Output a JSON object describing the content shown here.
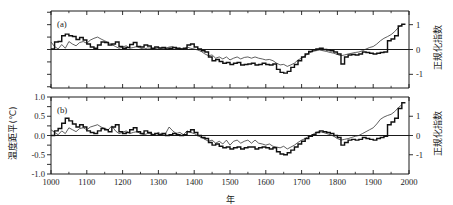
{
  "figure": {
    "xlabel": "年",
    "ylabel_left": "温度距平(℃)",
    "ylabel_right_a": "正规化指数",
    "ylabel_right_b": "正规化指数",
    "panel_a_tag": "(a)",
    "panel_b_tag": "(b)",
    "x_ticks": [
      "1000",
      "1100",
      "1200",
      "1300",
      "1400",
      "1500",
      "1600",
      "1700",
      "1800",
      "1900",
      "2000"
    ],
    "y_ticks_left_b": [
      "1.0",
      "0.5",
      "0.0",
      "-0.5",
      "-1.0"
    ],
    "y_ticks_right": [
      "1",
      "0",
      "-1"
    ],
    "line_color": "#111111",
    "thin_line_color": "#2b2b2b",
    "axis_color": "#1a1a1a",
    "background": "#ffffff"
  },
  "chart_data": [
    {
      "type": "line",
      "panel": "(a)",
      "title": "",
      "xlabel": "年",
      "ylabel": "正规化指数",
      "xlim": [
        1000,
        2000
      ],
      "ylim": [
        -1.55,
        1.55
      ],
      "grid": false,
      "legend": "none",
      "axis_right_ticks": [
        1,
        0,
        -1
      ],
      "zero_line": 0,
      "series": [
        {
          "name": "thick-stepped-reconstruction",
          "style": "thick step",
          "x": [
            1000,
            1010,
            1020,
            1030,
            1040,
            1050,
            1060,
            1070,
            1080,
            1090,
            1100,
            1110,
            1120,
            1130,
            1140,
            1150,
            1160,
            1170,
            1180,
            1190,
            1200,
            1210,
            1220,
            1230,
            1240,
            1250,
            1260,
            1270,
            1280,
            1290,
            1300,
            1310,
            1320,
            1330,
            1340,
            1350,
            1360,
            1370,
            1380,
            1390,
            1400,
            1410,
            1420,
            1430,
            1440,
            1450,
            1460,
            1470,
            1480,
            1490,
            1500,
            1510,
            1520,
            1530,
            1540,
            1550,
            1560,
            1570,
            1580,
            1590,
            1600,
            1610,
            1620,
            1630,
            1640,
            1650,
            1660,
            1670,
            1680,
            1690,
            1700,
            1710,
            1720,
            1730,
            1740,
            1750,
            1760,
            1770,
            1780,
            1790,
            1800,
            1810,
            1820,
            1830,
            1840,
            1850,
            1860,
            1870,
            1880,
            1890,
            1900,
            1910,
            1920,
            1930,
            1940,
            1950,
            1960,
            1970,
            1980
          ],
          "y": [
            0.02,
            0.3,
            0.32,
            0.55,
            0.62,
            0.55,
            0.52,
            0.4,
            0.48,
            0.38,
            0.22,
            0.1,
            0.05,
            0.18,
            0.3,
            0.28,
            0.18,
            0.22,
            0.3,
            0.12,
            0.05,
            0.08,
            0.2,
            0.28,
            0.12,
            0.1,
            0.18,
            0.14,
            0.05,
            0.1,
            0.06,
            0.08,
            0.02,
            0.05,
            0.08,
            0.05,
            0.02,
            0.05,
            0.18,
            0.22,
            0.1,
            0.02,
            -0.05,
            -0.1,
            -0.3,
            -0.45,
            -0.4,
            -0.48,
            -0.55,
            -0.52,
            -0.6,
            -0.55,
            -0.52,
            -0.62,
            -0.6,
            -0.58,
            -0.55,
            -0.62,
            -0.6,
            -0.55,
            -0.6,
            -0.62,
            -0.58,
            -0.8,
            -0.92,
            -0.95,
            -0.88,
            -0.72,
            -0.6,
            -0.45,
            -0.3,
            -0.18,
            -0.08,
            -0.02,
            0.02,
            0.05,
            0.0,
            -0.02,
            -0.05,
            -0.1,
            -0.18,
            -0.58,
            -0.3,
            -0.22,
            -0.2,
            -0.22,
            -0.18,
            -0.1,
            -0.12,
            -0.15,
            -0.18,
            -0.15,
            -0.12,
            -0.1,
            0.35,
            0.42,
            0.55,
            0.95,
            1.02
          ]
        },
        {
          "name": "thin-smoothed-index",
          "style": "thin line",
          "x": [
            1000,
            1010,
            1020,
            1030,
            1040,
            1050,
            1060,
            1070,
            1080,
            1090,
            1100,
            1110,
            1120,
            1130,
            1140,
            1150,
            1160,
            1170,
            1180,
            1190,
            1200,
            1210,
            1220,
            1230,
            1240,
            1250,
            1260,
            1270,
            1280,
            1290,
            1300,
            1310,
            1320,
            1330,
            1340,
            1350,
            1360,
            1370,
            1380,
            1390,
            1400,
            1410,
            1420,
            1430,
            1440,
            1450,
            1460,
            1470,
            1480,
            1490,
            1500,
            1510,
            1520,
            1530,
            1540,
            1550,
            1560,
            1570,
            1580,
            1590,
            1600,
            1610,
            1620,
            1630,
            1640,
            1650,
            1660,
            1670,
            1680,
            1690,
            1700,
            1710,
            1720,
            1730,
            1740,
            1750,
            1760,
            1770,
            1780,
            1790,
            1800,
            1810,
            1820,
            1830,
            1840,
            1850,
            1860,
            1870,
            1880,
            1890,
            1900,
            1910,
            1920,
            1930,
            1940,
            1950,
            1960,
            1970,
            1980
          ],
          "y": [
            0.3,
            0.12,
            0.02,
            0.2,
            0.05,
            0.32,
            0.22,
            0.15,
            0.28,
            0.32,
            0.25,
            0.38,
            0.45,
            0.5,
            0.42,
            0.35,
            0.28,
            0.2,
            0.12,
            0.05,
            0.1,
            0.15,
            0.05,
            0.08,
            0.12,
            0.05,
            0.02,
            0.06,
            0.05,
            0.02,
            0.08,
            0.02,
            0.05,
            0.1,
            0.12,
            0.02,
            0.05,
            0.0,
            0.1,
            0.05,
            0.02,
            -0.02,
            -0.08,
            -0.18,
            -0.25,
            -0.22,
            -0.35,
            -0.3,
            -0.38,
            -0.3,
            -0.42,
            -0.35,
            -0.3,
            -0.38,
            -0.32,
            -0.3,
            -0.35,
            -0.3,
            -0.35,
            -0.38,
            -0.42,
            -0.4,
            -0.45,
            -0.55,
            -0.62,
            -0.6,
            -0.68,
            -0.62,
            -0.55,
            -0.42,
            -0.35,
            -0.25,
            -0.15,
            -0.08,
            -0.05,
            -0.02,
            -0.05,
            -0.08,
            -0.12,
            -0.15,
            -0.2,
            -0.25,
            -0.22,
            -0.18,
            -0.15,
            -0.12,
            -0.1,
            -0.05,
            0.02,
            0.08,
            0.12,
            0.22,
            0.35,
            0.45,
            0.52,
            0.6,
            0.72,
            0.88,
            1.0
          ]
        }
      ]
    },
    {
      "type": "line",
      "panel": "(b)",
      "title": "",
      "xlabel": "年",
      "ylabel_left": "温度距平(℃)",
      "ylabel_right": "正规化指数",
      "xlim": [
        1000,
        2000
      ],
      "ylim_left": [
        -1.0,
        1.0
      ],
      "ylim_right": [
        -2.0,
        2.0
      ],
      "grid": false,
      "legend": "none",
      "axis_left_ticks": [
        1.0,
        0.5,
        0.0,
        -0.5,
        -1.0
      ],
      "axis_right_ticks": [
        1,
        0,
        -1
      ],
      "zero_line": 0,
      "series": [
        {
          "name": "thick-stepped-reconstruction",
          "style": "thick step",
          "x": [
            1000,
            1010,
            1020,
            1030,
            1040,
            1050,
            1060,
            1070,
            1080,
            1090,
            1100,
            1110,
            1120,
            1130,
            1140,
            1150,
            1160,
            1170,
            1180,
            1190,
            1200,
            1210,
            1220,
            1230,
            1240,
            1250,
            1260,
            1270,
            1280,
            1290,
            1300,
            1310,
            1320,
            1330,
            1340,
            1350,
            1360,
            1370,
            1380,
            1390,
            1400,
            1410,
            1420,
            1430,
            1440,
            1450,
            1460,
            1470,
            1480,
            1490,
            1500,
            1510,
            1520,
            1530,
            1540,
            1550,
            1560,
            1570,
            1580,
            1590,
            1600,
            1610,
            1620,
            1630,
            1640,
            1650,
            1660,
            1670,
            1680,
            1690,
            1700,
            1710,
            1720,
            1730,
            1740,
            1750,
            1760,
            1770,
            1780,
            1790,
            1800,
            1810,
            1820,
            1830,
            1840,
            1850,
            1860,
            1870,
            1880,
            1890,
            1900,
            1910,
            1920,
            1930,
            1940,
            1950,
            1960,
            1970,
            1980
          ],
          "y": [
            0.0,
            0.12,
            0.18,
            0.32,
            0.45,
            0.38,
            0.3,
            0.22,
            0.28,
            0.22,
            0.12,
            0.08,
            0.05,
            0.12,
            0.18,
            0.15,
            0.1,
            0.22,
            0.28,
            0.1,
            0.05,
            0.08,
            0.15,
            0.2,
            0.1,
            0.05,
            0.12,
            0.08,
            0.02,
            0.05,
            0.02,
            0.05,
            0.0,
            0.02,
            0.05,
            0.02,
            0.0,
            0.02,
            0.1,
            0.15,
            0.08,
            0.0,
            -0.05,
            -0.08,
            -0.18,
            -0.25,
            -0.22,
            -0.28,
            -0.32,
            -0.3,
            -0.35,
            -0.32,
            -0.3,
            -0.35,
            -0.32,
            -0.3,
            -0.3,
            -0.35,
            -0.32,
            -0.3,
            -0.32,
            -0.35,
            -0.32,
            -0.42,
            -0.48,
            -0.5,
            -0.45,
            -0.38,
            -0.3,
            -0.22,
            -0.15,
            -0.08,
            -0.02,
            0.02,
            0.08,
            0.12,
            0.1,
            0.08,
            0.05,
            0.0,
            -0.05,
            -0.25,
            -0.18,
            -0.12,
            -0.1,
            -0.12,
            -0.1,
            -0.05,
            -0.08,
            -0.1,
            -0.12,
            -0.08,
            -0.05,
            -0.02,
            0.28,
            0.35,
            0.45,
            0.7,
            0.85
          ]
        },
        {
          "name": "thin-smoothed-index",
          "style": "thin line",
          "x": [
            1000,
            1010,
            1020,
            1030,
            1040,
            1050,
            1060,
            1070,
            1080,
            1090,
            1100,
            1110,
            1120,
            1130,
            1140,
            1150,
            1160,
            1170,
            1180,
            1190,
            1200,
            1210,
            1220,
            1230,
            1240,
            1250,
            1260,
            1270,
            1280,
            1290,
            1300,
            1310,
            1320,
            1330,
            1340,
            1350,
            1360,
            1370,
            1380,
            1390,
            1400,
            1410,
            1420,
            1430,
            1440,
            1450,
            1460,
            1470,
            1480,
            1490,
            1500,
            1510,
            1520,
            1530,
            1540,
            1550,
            1560,
            1570,
            1580,
            1590,
            1600,
            1610,
            1620,
            1630,
            1640,
            1650,
            1660,
            1670,
            1680,
            1690,
            1700,
            1710,
            1720,
            1730,
            1740,
            1750,
            1760,
            1770,
            1780,
            1790,
            1800,
            1810,
            1820,
            1830,
            1840,
            1850,
            1860,
            1870,
            1880,
            1890,
            1900,
            1910,
            1920,
            1930,
            1940,
            1950,
            1960,
            1970,
            1980
          ],
          "y": [
            0.15,
            0.08,
            0.02,
            0.12,
            0.05,
            0.2,
            0.15,
            0.1,
            0.18,
            0.2,
            0.15,
            0.22,
            0.25,
            0.28,
            0.22,
            0.18,
            0.15,
            0.25,
            0.12,
            0.05,
            0.08,
            0.12,
            0.05,
            0.08,
            0.1,
            0.05,
            0.02,
            0.05,
            0.05,
            0.02,
            0.08,
            0.02,
            0.05,
            0.22,
            0.12,
            0.05,
            0.08,
            0.02,
            0.12,
            0.08,
            0.05,
            0.0,
            -0.05,
            -0.1,
            -0.15,
            -0.12,
            -0.2,
            -0.15,
            -0.22,
            -0.12,
            -0.25,
            -0.15,
            -0.12,
            -0.2,
            -0.15,
            -0.12,
            -0.2,
            -0.12,
            -0.2,
            -0.22,
            -0.25,
            -0.22,
            -0.28,
            -0.3,
            -0.32,
            -0.28,
            -0.35,
            -0.3,
            -0.25,
            -0.18,
            -0.12,
            -0.08,
            -0.02,
            0.02,
            0.08,
            0.1,
            0.08,
            0.05,
            0.02,
            -0.02,
            -0.08,
            -0.12,
            -0.1,
            -0.08,
            -0.05,
            -0.02,
            0.0,
            0.05,
            0.1,
            0.15,
            0.2,
            0.3,
            0.42,
            0.48,
            0.52,
            0.55,
            0.62,
            0.72,
            0.8
          ]
        }
      ]
    }
  ]
}
